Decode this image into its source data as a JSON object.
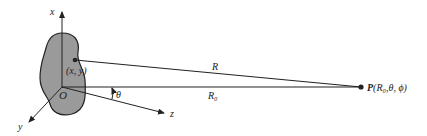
{
  "diagram": {
    "type": "coordinate-geometry",
    "colors": {
      "ink": "#222222",
      "blob_fill": "#9a9a9a",
      "background": "#ffffff"
    },
    "axes": {
      "x_label": "x",
      "y_label": "y",
      "z_label": "z"
    },
    "origin_label": "O",
    "source_point_label": "(x, y)",
    "angle_label": "θ",
    "distance_R_label": "R",
    "distance_R0_label": "R₀",
    "observation_point": {
      "prefix": "P",
      "coords": "(R₀,θ, ϕ)"
    }
  }
}
